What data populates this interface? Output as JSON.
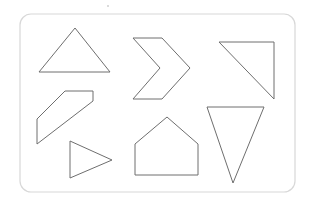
{
  "canvas": {
    "width": 313,
    "height": 210,
    "background_color": "#ffffff",
    "title": "Geometric shapes worksheet"
  },
  "frame": {
    "name": "rounded-rectangle-border",
    "x": 20,
    "y": 14,
    "width": 275,
    "height": 178,
    "corner_radius": 11,
    "stroke_color": "#d8d8d8",
    "fill_color": "#ffffff",
    "stroke_width": 1.2
  },
  "style": {
    "shape_stroke_color": "#6e6e6e",
    "shape_fill_color": "#ffffff",
    "shape_stroke_width": 1
  },
  "shapes": [
    {
      "id": "shape-1",
      "name": "triangle-isosceles-up",
      "label": "Isosceles triangle pointing up",
      "sides": 3,
      "points": "75,28 110,72 39,72",
      "bbox": [
        39,
        28,
        71,
        44
      ],
      "column": 1,
      "row": 1
    },
    {
      "id": "shape-2",
      "name": "chevron-right",
      "label": "Right-pointing chevron arrow",
      "sides": 6,
      "points": "133,38 162,38 190,68 162,99 133,99 160,68",
      "bbox": [
        133,
        38,
        57,
        61
      ],
      "column": 2,
      "row": 1
    },
    {
      "id": "shape-3",
      "name": "right-triangle-corner",
      "label": "Right triangle with vertical right edge",
      "sides": 3,
      "points": "219,42 274,42 274,99",
      "bbox": [
        219,
        42,
        55,
        57
      ],
      "column": 3,
      "row": 1
    },
    {
      "id": "shape-4",
      "name": "diagonal-band-parallelogram",
      "label": "Diagonal band quadrilateral",
      "sides": 5,
      "points": "37,119 65,91 93,91 93,101 37,144",
      "bbox": [
        37,
        91,
        56,
        53
      ],
      "column": 1,
      "row": 2
    },
    {
      "id": "shape-5",
      "name": "pentagon-house",
      "label": "House-shaped pentagon",
      "sides": 5,
      "points": "167,117 198,144 198,175 135,175 135,144",
      "bbox": [
        135,
        117,
        63,
        58
      ],
      "column": 2,
      "row": 2
    },
    {
      "id": "shape-6",
      "name": "triangle-inverted",
      "label": "Triangle pointing down",
      "sides": 3,
      "points": "207,107 264,107 233,183",
      "bbox": [
        207,
        107,
        57,
        76
      ],
      "column": 3,
      "row": 2
    },
    {
      "id": "shape-7",
      "name": "triangle-right-pointing",
      "label": "Triangle pointing right",
      "sides": 3,
      "points": "70,141 112,160 70,178",
      "bbox": [
        70,
        141,
        42,
        37
      ],
      "column": 1,
      "row": 3
    }
  ],
  "marks": [
    {
      "id": "mark-1",
      "name": "speck-artifact",
      "x": 108,
      "y": 6,
      "radius": 1,
      "color": "#cfcfcf"
    }
  ]
}
